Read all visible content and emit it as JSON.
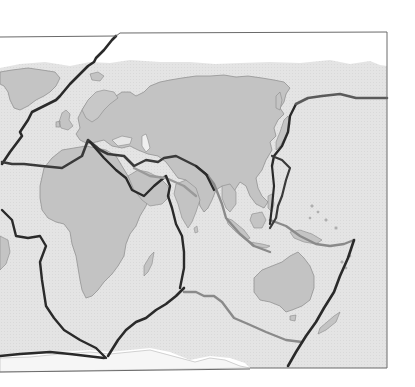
{
  "map": {
    "title": "",
    "subject": "tectonic-plate-boundaries",
    "projection": "world-map-cropped-europe-africa-asia-australia",
    "colors": {
      "background": "#ffffff",
      "ocean": "#e6e6e6",
      "land": "#c3c3c3",
      "coastline": "#8a8a8a",
      "frame": "#6a6a6a",
      "plate_boundary_dark": "#2a2a2a",
      "plate_boundary_light": "#9a9a9a"
    },
    "regions_visible": [
      "Greenland",
      "Europe",
      "Asia",
      "Africa",
      "Arabian Peninsula",
      "India",
      "Southeast Asia",
      "Japan",
      "Madagascar",
      "Australia",
      "New Zealand",
      "Antarctica coast"
    ],
    "plates_visible": [
      "Eurasian Plate",
      "African Plate",
      "North American Plate",
      "Arabian Plate",
      "Indian Plate",
      "Australian Plate",
      "Pacific Plate",
      "Philippine Plate",
      "Antarctic Plate"
    ],
    "labels": []
  }
}
